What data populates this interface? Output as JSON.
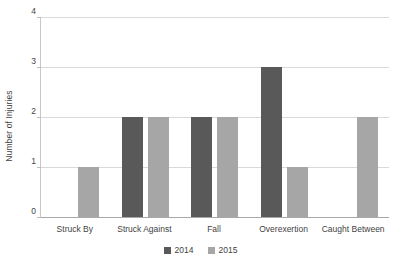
{
  "chart_data": {
    "type": "bar",
    "title": "",
    "xlabel": "",
    "ylabel": "Number of Injuries",
    "categories": [
      "Struck By",
      "Struck Against",
      "Fall",
      "Overexertion",
      "Caught Between"
    ],
    "series": [
      {
        "name": "2014",
        "color": "#595959",
        "values": [
          0,
          2,
          2,
          3,
          0
        ]
      },
      {
        "name": "2015",
        "color": "#a6a6a6",
        "values": [
          1,
          2,
          2,
          1,
          2
        ]
      }
    ],
    "ylim": [
      0,
      4
    ],
    "yticks": [
      0,
      1,
      2,
      3,
      4
    ],
    "ytick_labels": [
      "0",
      "1",
      "2",
      "3",
      "4"
    ],
    "grid": true,
    "grid_axis": "y",
    "legend_position": "bottom",
    "background": "#ffffff",
    "grid_color": "#d9d9d9",
    "axis_color": "#a8a8a8",
    "text_color": "#3f3f3f"
  }
}
